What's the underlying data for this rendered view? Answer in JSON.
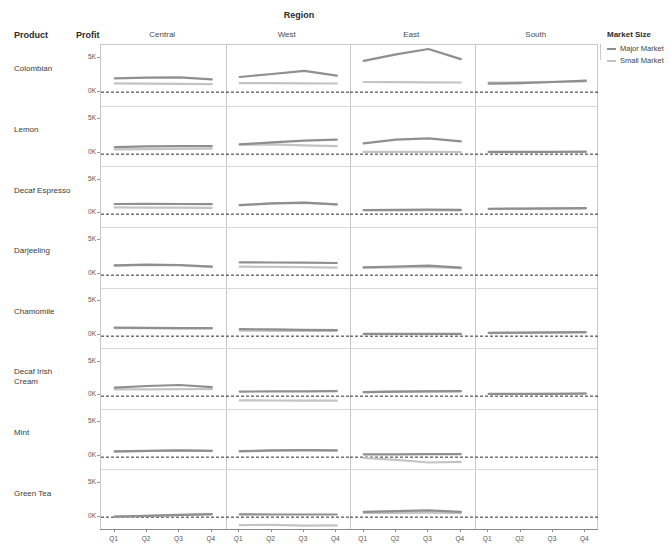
{
  "header": {
    "region_title": "Region",
    "product_header": "Product",
    "profit_header": "Profit"
  },
  "legend": {
    "title": "Market Size",
    "items": [
      {
        "label": "Major Market",
        "color": "#8f8f8f"
      },
      {
        "label": "Small Market",
        "color": "#c4c4c4"
      }
    ]
  },
  "axis": {
    "y_ticks": [
      "5K",
      "0K"
    ],
    "x_ticks": [
      "Q1",
      "Q2",
      "Q3",
      "Q4"
    ],
    "y_min": -2000,
    "y_max": 7000
  },
  "chart_data": {
    "type": "line",
    "title": "Region",
    "xlabel": "",
    "ylabel": "Profit",
    "grid": true,
    "legend_position": "right",
    "legend_title": "Market Size",
    "row_facet": "Product",
    "col_facet": "Region",
    "categories": [
      "Q1",
      "Q2",
      "Q3",
      "Q4"
    ],
    "columns": [
      "Central",
      "West",
      "East",
      "South"
    ],
    "rows": [
      "Colombian",
      "Lemon",
      "Decaf Espresso",
      "Darjeeling",
      "Chamomile",
      "Decaf Irish Cream",
      "Mint",
      "Green Tea"
    ],
    "series_names": [
      "Major Market",
      "Small Market"
    ],
    "ylim": [
      -2000,
      7000
    ],
    "panels": [
      {
        "row": "Colombian",
        "cells": [
          {
            "col": "Central",
            "series": [
              {
                "name": "Major Market",
                "values": [
                  2050,
                  2150,
                  2200,
                  1900
                ]
              },
              {
                "name": "Small Market",
                "values": [
                  1300,
                  1250,
                  1220,
                  1200
                ]
              }
            ]
          },
          {
            "col": "West",
            "series": [
              {
                "name": "Major Market",
                "values": [
                  2250,
                  2700,
                  3150,
                  2450
                ]
              },
              {
                "name": "Small Market",
                "values": [
                  1350,
                  1330,
                  1310,
                  1280
                ]
              }
            ]
          },
          {
            "col": "East",
            "series": [
              {
                "name": "Major Market",
                "values": [
                  4650,
                  5600,
                  6400,
                  4900
                ]
              },
              {
                "name": "Small Market",
                "values": [
                  1500,
                  1480,
                  1460,
                  1440
                ]
              }
            ]
          },
          {
            "col": "South",
            "series": [
              {
                "name": "Major Market",
                "values": [
                  1250,
                  1350,
                  1500,
                  1700
                ]
              },
              {
                "name": "Small Market",
                "values": [
                  1400,
                  1450,
                  1520,
                  1600
                ]
              }
            ]
          }
        ]
      },
      {
        "row": "Lemon",
        "cells": [
          {
            "col": "Central",
            "series": [
              {
                "name": "Major Market",
                "values": [
                  1050,
                  1150,
                  1200,
                  1180
                ]
              },
              {
                "name": "Small Market",
                "values": [
                  700,
                  750,
                  800,
                  820
                ]
              }
            ]
          },
          {
            "col": "West",
            "series": [
              {
                "name": "Major Market",
                "values": [
                  1450,
                  1750,
                  2000,
                  2150
                ]
              },
              {
                "name": "Small Market",
                "values": [
                  1400,
                  1450,
                  1300,
                  1180
                ]
              }
            ]
          },
          {
            "col": "East",
            "series": [
              {
                "name": "Major Market",
                "values": [
                  1600,
                  2150,
                  2350,
                  1900
                ]
              },
              {
                "name": "Small Market",
                "values": [
                  350,
                  340,
                  330,
                  320
                ]
              }
            ]
          },
          {
            "col": "South",
            "series": [
              {
                "name": "Major Market",
                "values": [
                  330,
                  340,
                  350,
                  360
                ]
              },
              {
                "name": "Small Market",
                "values": [
                  300,
                  310,
                  315,
                  320
                ]
              }
            ]
          }
        ]
      },
      {
        "row": "Decaf Espresso",
        "cells": [
          {
            "col": "Central",
            "series": [
              {
                "name": "Major Market",
                "values": [
                  1500,
                  1520,
                  1500,
                  1480
                ]
              },
              {
                "name": "Small Market",
                "values": [
                  1000,
                  980,
                  960,
                  940
                ]
              }
            ]
          },
          {
            "col": "West",
            "series": [
              {
                "name": "Major Market",
                "values": [
                  1350,
                  1600,
                  1700,
                  1450
                ]
              },
              {
                "name": "Small Market",
                "values": [
                  1340,
                  1580,
                  1680,
                  1430
                ]
              }
            ]
          },
          {
            "col": "East",
            "series": [
              {
                "name": "Major Market",
                "values": [
                  620,
                  640,
                  660,
                  650
                ]
              },
              {
                "name": "Small Market",
                "values": [
                  560,
                  570,
                  580,
                  575
                ]
              }
            ]
          },
          {
            "col": "South",
            "series": [
              {
                "name": "Major Market",
                "values": [
                  800,
                  830,
                  860,
                  880
                ]
              },
              {
                "name": "Small Market",
                "values": [
                  760,
                  790,
                  820,
                  840
                ]
              }
            ]
          }
        ]
      },
      {
        "row": "Darjeeling",
        "cells": [
          {
            "col": "Central",
            "series": [
              {
                "name": "Major Market",
                "values": [
                  1450,
                  1550,
                  1500,
                  1250
                ]
              },
              {
                "name": "Small Market",
                "values": [
                  1400,
                  1500,
                  1450,
                  1230
                ]
              }
            ]
          },
          {
            "col": "West",
            "series": [
              {
                "name": "Major Market",
                "values": [
                  1900,
                  1880,
                  1850,
                  1800
                ]
              },
              {
                "name": "Small Market",
                "values": [
                  1250,
                  1220,
                  1180,
                  1100
                ]
              }
            ]
          },
          {
            "col": "East",
            "series": [
              {
                "name": "Major Market",
                "values": [
                  1150,
                  1280,
                  1400,
                  1100
                ]
              },
              {
                "name": "Small Market",
                "values": [
                  1100,
                  1150,
                  1230,
                  1050
                ]
              }
            ]
          },
          {
            "col": "South",
            "series": [
              {
                "name": "Major Market",
                "values": [
                  null,
                  null,
                  null,
                  null
                ]
              },
              {
                "name": "Small Market",
                "values": [
                  null,
                  null,
                  null,
                  null
                ]
              }
            ]
          }
        ]
      },
      {
        "row": "Chamomile",
        "cells": [
          {
            "col": "Central",
            "series": [
              {
                "name": "Major Market",
                "values": [
                  1250,
                  1230,
                  1200,
                  1180
                ]
              },
              {
                "name": "Small Market",
                "values": [
                  1200,
                  1180,
                  1160,
                  1150
                ]
              }
            ]
          },
          {
            "col": "West",
            "series": [
              {
                "name": "Major Market",
                "values": [
                  1050,
                  1000,
                  950,
                  900
                ]
              },
              {
                "name": "Small Market",
                "values": [
                  820,
                  800,
                  790,
                  780
                ]
              }
            ]
          },
          {
            "col": "East",
            "series": [
              {
                "name": "Major Market",
                "values": [
                  330,
                  335,
                  340,
                  345
                ]
              },
              {
                "name": "Small Market",
                "values": [
                  300,
                  305,
                  310,
                  315
                ]
              }
            ]
          },
          {
            "col": "South",
            "series": [
              {
                "name": "Major Market",
                "values": [
                  480,
                  520,
                  560,
                  600
                ]
              },
              {
                "name": "Small Market",
                "values": [
                  450,
                  490,
                  530,
                  570
                ]
              }
            ]
          }
        ]
      },
      {
        "row": "Decaf Irish Cream",
        "cells": [
          {
            "col": "Central",
            "series": [
              {
                "name": "Major Market",
                "values": [
                  1250,
                  1500,
                  1650,
                  1350
                ]
              },
              {
                "name": "Small Market",
                "values": [
                  1000,
                  1020,
                  1050,
                  1030
                ]
              }
            ]
          },
          {
            "col": "West",
            "series": [
              {
                "name": "Major Market",
                "values": [
                  680,
                  700,
                  720,
                  740
                ]
              },
              {
                "name": "Small Market",
                "values": [
                  -620,
                  -650,
                  -670,
                  -680
                ]
              }
            ]
          },
          {
            "col": "East",
            "series": [
              {
                "name": "Major Market",
                "values": [
                  600,
                  680,
                  720,
                  740
                ]
              },
              {
                "name": "Small Market",
                "values": [
                  580,
                  660,
                  700,
                  720
                ]
              }
            ]
          },
          {
            "col": "South",
            "series": [
              {
                "name": "Major Market",
                "values": [
                  330,
                  340,
                  350,
                  400
                ]
              },
              {
                "name": "Small Market",
                "values": [
                  310,
                  320,
                  330,
                  380
                ]
              }
            ]
          }
        ]
      },
      {
        "row": "Mint",
        "cells": [
          {
            "col": "Central",
            "series": [
              {
                "name": "Major Market",
                "values": [
                  850,
                  950,
                  1000,
                  950
                ]
              },
              {
                "name": "Small Market",
                "values": [
                  820,
                  920,
                  970,
                  930
                ]
              }
            ]
          },
          {
            "col": "West",
            "series": [
              {
                "name": "Major Market",
                "values": [
                  880,
                  1000,
                  1050,
                  1000
                ]
              },
              {
                "name": "Small Market",
                "values": [
                  850,
                  970,
                  1020,
                  980
                ]
              }
            ]
          },
          {
            "col": "East",
            "series": [
              {
                "name": "Major Market",
                "values": [
                  420,
                  430,
                  440,
                  450
                ]
              },
              {
                "name": "Small Market",
                "values": [
                  -120,
                  -400,
                  -800,
                  -700
                ]
              }
            ]
          },
          {
            "col": "South",
            "series": [
              {
                "name": "Major Market",
                "values": [
                  null,
                  null,
                  null,
                  null
                ]
              },
              {
                "name": "Small Market",
                "values": [
                  null,
                  null,
                  null,
                  null
                ]
              }
            ]
          }
        ]
      },
      {
        "row": "Green Tea",
        "cells": [
          {
            "col": "Central",
            "series": [
              {
                "name": "Major Market",
                "values": [
                  80,
                  200,
                  330,
                  450
                ]
              },
              {
                "name": "Small Market",
                "values": [
                  60,
                  180,
                  310,
                  420
                ]
              }
            ]
          },
          {
            "col": "West",
            "series": [
              {
                "name": "Major Market",
                "values": [
                  420,
                  400,
                  390,
                  400
                ]
              },
              {
                "name": "Small Market",
                "values": [
                  -1180,
                  -1150,
                  -1250,
                  -1220
                ]
              }
            ]
          },
          {
            "col": "East",
            "series": [
              {
                "name": "Major Market",
                "values": [
                  800,
                  900,
                  1000,
                  780
                ]
              },
              {
                "name": "Small Market",
                "values": [
                  620,
                  640,
                  660,
                  600
                ]
              }
            ]
          },
          {
            "col": "South",
            "series": [
              {
                "name": "Major Market",
                "values": [
                  null,
                  null,
                  null,
                  null
                ]
              },
              {
                "name": "Small Market",
                "values": [
                  null,
                  null,
                  null,
                  null
                ]
              }
            ]
          }
        ]
      }
    ]
  }
}
